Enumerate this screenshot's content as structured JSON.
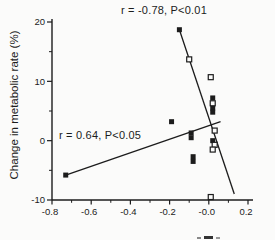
{
  "figure": {
    "background": "#fbfbfa",
    "ink_color": "#1c1c1c"
  },
  "chart_data": {
    "type": "scatter",
    "title": "",
    "xlabel": "",
    "ylabel": "Change in metabolic rate (%)",
    "xlim": [
      -0.8,
      0.2
    ],
    "ylim": [
      -10,
      20
    ],
    "grid": false,
    "x_tick_labels": [
      "-0.8",
      "-0.6",
      "-0.4",
      "-0.2",
      "-0.0",
      "0.2"
    ],
    "x_tick_values": [
      -0.8,
      -0.6,
      -0.4,
      -0.2,
      0.0,
      0.2
    ],
    "x_minor_tick_values": [
      -0.7,
      -0.5,
      -0.3,
      -0.1,
      0.1
    ],
    "y_tick_labels": [
      "20",
      "10",
      "0",
      "-10"
    ],
    "y_tick_values": [
      20,
      10,
      0,
      -10
    ],
    "y_minor_tick_values": [
      15,
      5,
      -5
    ],
    "x_axis_label_clipped_fragment_visible": true,
    "annotations": [
      {
        "id": "negative-correlation",
        "text": "r = -0.78, P<0.01"
      },
      {
        "id": "positive-correlation",
        "text": "r = 0.64, P<0.05"
      }
    ],
    "series": [
      {
        "name": "filled-squares",
        "marker": "filled-square",
        "points": [
          [
            -0.15,
            18.7
          ],
          [
            0.02,
            7.2
          ],
          [
            0.02,
            5.5
          ],
          [
            0.02,
            4.8
          ],
          [
            -0.19,
            3.2
          ],
          [
            -0.09,
            1.3
          ],
          [
            -0.09,
            0.5
          ],
          [
            0.02,
            0.0
          ],
          [
            -0.08,
            -2.7
          ],
          [
            -0.08,
            -3.5
          ],
          [
            -0.73,
            -5.8
          ]
        ]
      },
      {
        "name": "open-squares",
        "marker": "open-square",
        "points": [
          [
            -0.1,
            13.7
          ],
          [
            0.01,
            10.7
          ],
          [
            0.02,
            6.3
          ],
          [
            0.03,
            1.7
          ],
          [
            0.03,
            -0.7
          ],
          [
            0.02,
            -1.5
          ],
          [
            0.01,
            -9.5
          ]
        ]
      }
    ],
    "lines": [
      {
        "name": "steep-negative-regression",
        "annotation": "r = -0.78, P<0.01",
        "x1": -0.15,
        "y1": 18.7,
        "x2": 0.13,
        "y2": -9.0
      },
      {
        "name": "shallow-positive-regression",
        "annotation": "r = 0.64, P<0.05",
        "x1": -0.73,
        "y1": -5.8,
        "x2": 0.06,
        "y2": 3.2
      }
    ]
  }
}
